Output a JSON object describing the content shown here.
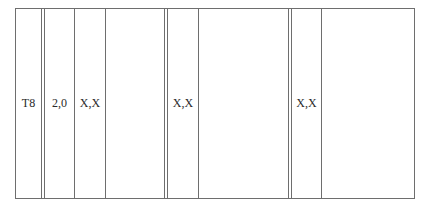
{
  "diagram": {
    "cells": [
      {
        "label": "T8"
      },
      {
        "label": "2,0"
      },
      {
        "label": "X,X"
      },
      {
        "label": ""
      },
      {
        "label": "X,X"
      },
      {
        "label": ""
      },
      {
        "label": "X,X"
      },
      {
        "label": ""
      }
    ],
    "line_color": "#6e6e6e",
    "text_color": "#2a2a2a"
  }
}
